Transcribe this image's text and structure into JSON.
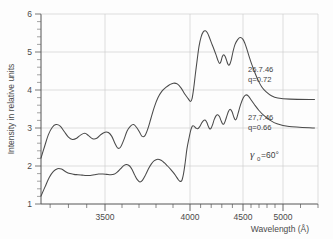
{
  "chart_data": {
    "type": "line",
    "title": "",
    "xlabel": "Wavelength (Å)",
    "ylabel": "Intensity in relative units",
    "xlim": [
      3150,
      5200
    ],
    "ylim": [
      1,
      6
    ],
    "grid": true,
    "x_scale": "prism-dispersion (non-linear, compressing toward red)",
    "xticks": [
      3500,
      4000,
      4500,
      5000
    ],
    "xticklabels": [
      "3500",
      "4000",
      "4500",
      "5000"
    ],
    "yticks": [
      1,
      2,
      3,
      4,
      5,
      6
    ],
    "yticklabels": [
      "1",
      "2",
      "3",
      "4",
      "5",
      "6"
    ],
    "legend_position": "inline annotations on curves",
    "annotations": [
      {
        "name": "upper-curve-label",
        "line1": "26.7.46",
        "line2": "q=0.72",
        "x_px": 248,
        "y_px": 70
      },
      {
        "name": "lower-curve-label",
        "line1": "27,7.46",
        "line2": "q=0.66",
        "x_px": 248,
        "y_px": 118
      },
      {
        "name": "gamma-label",
        "symbol": "γ",
        "subscript": "0",
        "value": "=60°",
        "x_px": 252,
        "y_px": 155
      }
    ],
    "series": [
      {
        "name": "26.7.46",
        "label": "26.7.46  q=0.72",
        "q": 0.72,
        "date": "26.7.46",
        "points": [
          [
            3150,
            2.21
          ],
          [
            3170,
            2.52
          ],
          [
            3190,
            2.82
          ],
          [
            3212,
            3.02
          ],
          [
            3232,
            3.09
          ],
          [
            3255,
            3.05
          ],
          [
            3278,
            2.9
          ],
          [
            3300,
            2.76
          ],
          [
            3322,
            2.7
          ],
          [
            3345,
            2.73
          ],
          [
            3368,
            2.82
          ],
          [
            3390,
            2.86
          ],
          [
            3410,
            2.8
          ],
          [
            3432,
            2.72
          ],
          [
            3455,
            2.73
          ],
          [
            3478,
            2.83
          ],
          [
            3500,
            2.89
          ],
          [
            3520,
            2.88
          ],
          [
            3540,
            2.78
          ],
          [
            3558,
            2.6
          ],
          [
            3575,
            2.47
          ],
          [
            3592,
            2.5
          ],
          [
            3610,
            2.68
          ],
          [
            3630,
            2.92
          ],
          [
            3650,
            3.05
          ],
          [
            3668,
            3.09
          ],
          [
            3685,
            3.02
          ],
          [
            3702,
            2.9
          ],
          [
            3718,
            2.78
          ],
          [
            3735,
            2.8
          ],
          [
            3752,
            2.98
          ],
          [
            3770,
            3.25
          ],
          [
            3790,
            3.55
          ],
          [
            3812,
            3.8
          ],
          [
            3835,
            3.97
          ],
          [
            3858,
            4.07
          ],
          [
            3880,
            4.14
          ],
          [
            3902,
            4.18
          ],
          [
            3925,
            4.16
          ],
          [
            3948,
            4.05
          ],
          [
            3968,
            3.9
          ],
          [
            3988,
            3.78
          ],
          [
            4005,
            3.7
          ],
          [
            4020,
            3.78
          ],
          [
            4035,
            4.05
          ],
          [
            4050,
            4.4
          ],
          [
            4068,
            4.8
          ],
          [
            4085,
            5.15
          ],
          [
            4105,
            5.4
          ],
          [
            4125,
            5.53
          ],
          [
            4145,
            5.56
          ],
          [
            4165,
            5.5
          ],
          [
            4185,
            5.37
          ],
          [
            4205,
            5.22
          ],
          [
            4225,
            5.08
          ],
          [
            4245,
            4.93
          ],
          [
            4262,
            4.79
          ],
          [
            4278,
            4.7
          ],
          [
            4292,
            4.75
          ],
          [
            4305,
            4.88
          ],
          [
            4318,
            4.93
          ],
          [
            4332,
            4.88
          ],
          [
            4345,
            4.78
          ],
          [
            4358,
            4.68
          ],
          [
            4372,
            4.66
          ],
          [
            4388,
            4.78
          ],
          [
            4405,
            5.0
          ],
          [
            4425,
            5.2
          ],
          [
            4448,
            5.32
          ],
          [
            4472,
            5.38
          ],
          [
            4498,
            5.34
          ],
          [
            4525,
            5.22
          ],
          [
            4552,
            5.05
          ],
          [
            4580,
            4.86
          ],
          [
            4612,
            4.66
          ],
          [
            4648,
            4.46
          ],
          [
            4688,
            4.26
          ],
          [
            4735,
            4.08
          ],
          [
            4790,
            3.95
          ],
          [
            4855,
            3.85
          ],
          [
            4935,
            3.79
          ],
          [
            5040,
            3.76
          ],
          [
            5180,
            3.75
          ]
        ]
      },
      {
        "name": "27,7.46",
        "label": "27,7.46  q=0.66",
        "q": 0.66,
        "date": "27,7.46",
        "points": [
          [
            3150,
            1.21
          ],
          [
            3172,
            1.45
          ],
          [
            3195,
            1.7
          ],
          [
            3218,
            1.86
          ],
          [
            3240,
            1.93
          ],
          [
            3262,
            1.92
          ],
          [
            3285,
            1.85
          ],
          [
            3308,
            1.8
          ],
          [
            3330,
            1.78
          ],
          [
            3352,
            1.77
          ],
          [
            3375,
            1.76
          ],
          [
            3398,
            1.75
          ],
          [
            3420,
            1.75
          ],
          [
            3442,
            1.77
          ],
          [
            3465,
            1.79
          ],
          [
            3488,
            1.79
          ],
          [
            3510,
            1.78
          ],
          [
            3532,
            1.77
          ],
          [
            3552,
            1.78
          ],
          [
            3572,
            1.84
          ],
          [
            3592,
            1.93
          ],
          [
            3610,
            2.01
          ],
          [
            3628,
            2.04
          ],
          [
            3645,
            2.0
          ],
          [
            3660,
            1.9
          ],
          [
            3675,
            1.76
          ],
          [
            3690,
            1.64
          ],
          [
            3705,
            1.58
          ],
          [
            3720,
            1.62
          ],
          [
            3738,
            1.76
          ],
          [
            3755,
            1.92
          ],
          [
            3772,
            2.05
          ],
          [
            3790,
            2.14
          ],
          [
            3810,
            2.18
          ],
          [
            3830,
            2.15
          ],
          [
            3850,
            2.08
          ],
          [
            3868,
            2.0
          ],
          [
            3885,
            1.92
          ],
          [
            3900,
            1.84
          ],
          [
            3915,
            1.75
          ],
          [
            3928,
            1.66
          ],
          [
            3940,
            1.6
          ],
          [
            3952,
            1.62
          ],
          [
            3962,
            1.8
          ],
          [
            3972,
            2.1
          ],
          [
            3982,
            2.45
          ],
          [
            3995,
            2.75
          ],
          [
            4008,
            2.95
          ],
          [
            4022,
            3.05
          ],
          [
            4038,
            3.05
          ],
          [
            4055,
            3.0
          ],
          [
            4072,
            2.98
          ],
          [
            4090,
            3.03
          ],
          [
            4108,
            3.12
          ],
          [
            4125,
            3.19
          ],
          [
            4142,
            3.21
          ],
          [
            4158,
            3.15
          ],
          [
            4172,
            3.05
          ],
          [
            4185,
            2.98
          ],
          [
            4198,
            2.99
          ],
          [
            4212,
            3.08
          ],
          [
            4228,
            3.22
          ],
          [
            4245,
            3.32
          ],
          [
            4262,
            3.35
          ],
          [
            4278,
            3.3
          ],
          [
            4292,
            3.2
          ],
          [
            4305,
            3.12
          ],
          [
            4318,
            3.1
          ],
          [
            4332,
            3.18
          ],
          [
            4348,
            3.32
          ],
          [
            4365,
            3.45
          ],
          [
            4382,
            3.49
          ],
          [
            4398,
            3.42
          ],
          [
            4412,
            3.3
          ],
          [
            4425,
            3.22
          ],
          [
            4438,
            3.24
          ],
          [
            4455,
            3.4
          ],
          [
            4478,
            3.62
          ],
          [
            4505,
            3.8
          ],
          [
            4535,
            3.87
          ],
          [
            4568,
            3.84
          ],
          [
            4605,
            3.73
          ],
          [
            4648,
            3.6
          ],
          [
            4700,
            3.46
          ],
          [
            4760,
            3.33
          ],
          [
            4835,
            3.21
          ],
          [
            4925,
            3.11
          ],
          [
            5035,
            3.04
          ],
          [
            5180,
            3.0
          ]
        ]
      }
    ]
  },
  "figure": {
    "y_axis_title": "Intensity in relative units",
    "x_axis_title": "Wavelength (Å)",
    "y_tick_1": "1",
    "y_tick_2": "2",
    "y_tick_3": "3",
    "y_tick_4": "4",
    "y_tick_5": "5",
    "y_tick_6": "6",
    "x_tick_3500": "3500",
    "x_tick_4000": "4000",
    "x_tick_4500": "4500",
    "x_tick_5000": "5000",
    "upper_label_line1": "26.7.46",
    "upper_label_line2": "q=0.72",
    "lower_label_line1": "27,7.46",
    "lower_label_line2": "q=0.66",
    "gamma_symbol": "γ",
    "gamma_subscript": "0",
    "gamma_value": "=60°"
  }
}
